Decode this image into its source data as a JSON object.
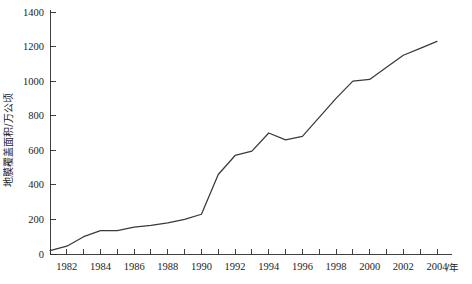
{
  "chart_data": {
    "type": "line",
    "title": "",
    "xlabel": "/年",
    "ylabel": "地膜覆盖面积/万公顷",
    "xlim": [
      1981,
      2004
    ],
    "ylim": [
      0,
      1400
    ],
    "ytick_step": 200,
    "xtick_step": 1,
    "xtick_label_step": 2,
    "grid": false,
    "legend": false,
    "yticks": [
      0,
      200,
      400,
      600,
      800,
      1000,
      1200,
      1400
    ],
    "ytick_labels": [
      "0",
      "200",
      "400",
      "600",
      "800",
      "1000",
      "1200",
      "1400"
    ],
    "xticks": [
      1981,
      1982,
      1983,
      1984,
      1985,
      1986,
      1987,
      1988,
      1989,
      1990,
      1991,
      1992,
      1993,
      1994,
      1995,
      1996,
      1997,
      1998,
      1999,
      2000,
      2001,
      2002,
      2003,
      2004
    ],
    "xtick_labels": [
      "",
      "1982",
      "",
      "1984",
      "",
      "1986",
      "",
      "1988",
      "",
      "1990",
      "",
      "1992",
      "",
      "1994",
      "",
      "1996",
      "",
      "1998",
      "",
      "2000",
      "",
      "2002",
      "",
      "2004"
    ],
    "series": [
      {
        "name": "地膜覆盖面积",
        "color": "#3a3a3a",
        "x": [
          1981,
          1982,
          1983,
          1984,
          1985,
          1986,
          1987,
          1988,
          1989,
          1990,
          1991,
          1992,
          1993,
          1994,
          1995,
          1996,
          1997,
          1998,
          1999,
          2000,
          2001,
          2002,
          2003,
          2004
        ],
        "values": [
          20,
          45,
          100,
          135,
          135,
          155,
          165,
          180,
          200,
          230,
          460,
          570,
          595,
          700,
          660,
          680,
          790,
          900,
          1000,
          1010,
          1080,
          1150,
          1190,
          1230
        ]
      }
    ]
  },
  "axes": {
    "y_axis_title": "地膜覆盖面积/万公顷",
    "x_axis_unit": "/年"
  }
}
